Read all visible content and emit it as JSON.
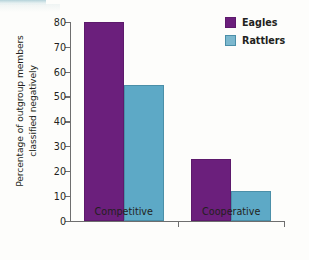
{
  "chart_data": {
    "type": "bar",
    "title": "",
    "subtitle": "",
    "xlabel": "",
    "ylabel": "Percentage of outgroup members classified negatively",
    "ylabel_line1": "Percentage of outgroup members",
    "ylabel_line2": "classified negatively",
    "categories": [
      "Competitive",
      "Cooperative"
    ],
    "series": [
      {
        "name": "Eagles",
        "values": [
          80,
          25
        ],
        "color": "#6b1f7c"
      },
      {
        "name": "Rattlers",
        "values": [
          54.5,
          12
        ],
        "color": "#5da9c6"
      }
    ],
    "ylim": [
      0,
      80
    ],
    "yticks": [
      0,
      10,
      20,
      30,
      40,
      50,
      60,
      70,
      80
    ],
    "ytick_labels": [
      "0",
      "10",
      "20",
      "30",
      "40",
      "50",
      "60",
      "70",
      "80"
    ],
    "grid": false,
    "legend_position": "top-right",
    "legend": [
      {
        "label": "Eagles",
        "color": "#6b1f7c"
      },
      {
        "label": "Rattlers",
        "color": "#7cb8ce"
      }
    ],
    "axis_color": "#6e6e6e",
    "background": "#fdfdfb"
  }
}
